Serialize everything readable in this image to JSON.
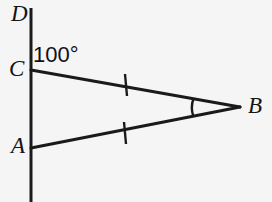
{
  "figure": {
    "background_color": "#f5f5f5",
    "stroke_color": "#1a1a1a",
    "labels": {
      "D": "D",
      "C": "C",
      "A": "A",
      "B": "B",
      "angle_DCB": "100°"
    },
    "points": {
      "D": {
        "x": 31,
        "y": 8
      },
      "C": {
        "x": 31,
        "y": 70
      },
      "A": {
        "x": 31,
        "y": 148
      },
      "B": {
        "x": 240,
        "y": 107
      },
      "line_bottom": {
        "x": 31,
        "y": 202
      }
    },
    "segments": [
      {
        "name": "vertical-line-DA",
        "from": "D",
        "to": "line_bottom"
      },
      {
        "name": "segment-CB",
        "from": "C",
        "to": "B"
      },
      {
        "name": "segment-AB",
        "from": "A",
        "to": "B"
      }
    ],
    "tick_marks": [
      {
        "name": "tick-CB",
        "x": 125,
        "y": 85,
        "marks": 1
      },
      {
        "name": "tick-AB",
        "x": 125,
        "y": 133,
        "marks": 1
      }
    ],
    "angle_arcs": [
      {
        "name": "arc-at-B",
        "vertex": "B",
        "x": 193,
        "marks": 1
      }
    ]
  }
}
